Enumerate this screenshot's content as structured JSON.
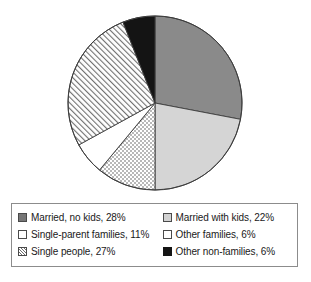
{
  "chart_data": {
    "type": "pie",
    "title": "",
    "subtitle": "",
    "xlabel": "",
    "ylabel": "",
    "legend_position": "bottom",
    "grid": false,
    "start_angle_deg": 0,
    "direction": "clockwise",
    "total_percent": 100,
    "categories": [
      "Married, no kids",
      "Married with kids",
      "Single-parent families",
      "Other families",
      "Single people",
      "Other non-families"
    ],
    "values": [
      28,
      22,
      11,
      6,
      27,
      6
    ],
    "slices": [
      {
        "label": "Married, no kids",
        "value": 28,
        "percent_text": "28%",
        "fill": "solid-dark",
        "color": "#8a8a8a",
        "start_deg": 0,
        "end_deg": 100.8
      },
      {
        "label": "Married with kids",
        "value": 22,
        "percent_text": "22%",
        "fill": "solid-light",
        "color": "#d5d5d5",
        "start_deg": 100.8,
        "end_deg": 180.0
      },
      {
        "label": "Single-parent families",
        "value": 11,
        "percent_text": "11%",
        "fill": "dotted",
        "color": "#ffffff",
        "start_deg": 180.0,
        "end_deg": 219.6
      },
      {
        "label": "Other families",
        "value": 6,
        "percent_text": "6%",
        "fill": "solid-white",
        "color": "#ffffff",
        "start_deg": 219.6,
        "end_deg": 241.2
      },
      {
        "label": "Single people",
        "value": 27,
        "percent_text": "27%",
        "fill": "hatched",
        "color": "#ffffff",
        "start_deg": 241.2,
        "end_deg": 338.4
      },
      {
        "label": "Other non-families",
        "value": 6,
        "percent_text": "6%",
        "fill": "solid-black",
        "color": "#141414",
        "start_deg": 338.4,
        "end_deg": 360.0
      }
    ]
  },
  "legend": {
    "columns": [
      {
        "items": [
          {
            "text": "Married, no kids, 28%",
            "swatch": "solid-dark"
          },
          {
            "text": "Single-parent families, 11%",
            "swatch": "dotted"
          },
          {
            "text": "Single people, 27%",
            "swatch": "hatched"
          }
        ]
      },
      {
        "items": [
          {
            "text": "Married with kids, 22%",
            "swatch": "solid-light"
          },
          {
            "text": "Other families, 6%",
            "swatch": "solid-white"
          },
          {
            "text": "Other non-families, 6%",
            "swatch": "solid-black"
          }
        ]
      }
    ]
  }
}
